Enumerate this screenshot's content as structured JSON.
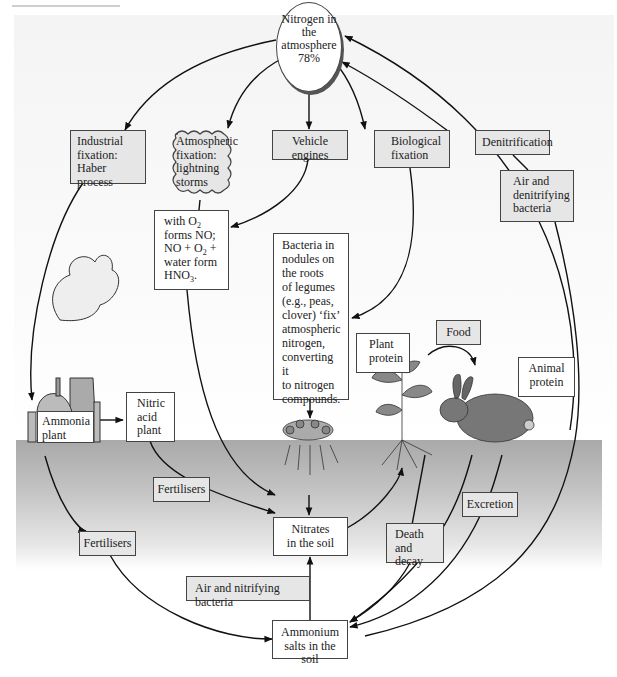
{
  "diagram": {
    "nodes": {
      "atmosphere": "Nitrogen in the atmosphere 78%",
      "industrial_fixation": [
        "Industrial",
        "fixation:",
        "Haber process"
      ],
      "atmospheric_fixation": [
        "Atmospheric",
        "fixation:",
        "lightning",
        "storms"
      ],
      "vehicle_engines": [
        "Vehicle",
        "engines"
      ],
      "biological_fixation": [
        "Biological",
        "fixation"
      ],
      "denitrification": "Denitrification",
      "air_denitrifying": [
        "Air and",
        "denitrifying",
        "bacteria"
      ],
      "no_formation": {
        "line1_pre": "with O",
        "line1_sub": "2",
        "line2": "forms NO;",
        "line3_pre": "NO + O",
        "line3_sub": "2",
        "line3_post": " +",
        "line4": "water form",
        "line5_pre": "HNO",
        "line5_sub": "3",
        "line5_post": "."
      },
      "legume_bacteria": [
        "Bacteria in",
        "nodules on",
        "the roots",
        "of legumes",
        "(e.g., peas,",
        "clover) ‘fix’",
        "atmospheric",
        "nitrogen,",
        "converting it",
        "to nitrogen",
        "compounds."
      ],
      "plant_protein": [
        "Plant",
        "protein"
      ],
      "food": "Food",
      "animal_protein": [
        "Animal",
        "protein"
      ],
      "ammonia_plant": [
        "Ammonia",
        "plant"
      ],
      "nitric_acid_plant": [
        "Nitric",
        "acid",
        "plant"
      ],
      "fertilisers_upper": "Fertilisers",
      "fertilisers_lower": "Fertilisers",
      "nitrates_soil": [
        "Nitrates",
        "in the soil"
      ],
      "excretion": "Excretion",
      "death_decay": [
        "Death",
        "and decay"
      ],
      "air_nitrifying": "Air and nitrifying bacteria",
      "ammonium_salts": [
        "Ammonium",
        "salts in the soil"
      ]
    },
    "illustrations": [
      "factory-smokestack",
      "legume-plant-with-root-nodules",
      "seedling-plant",
      "rabbit",
      "soil-layer"
    ],
    "colors": {
      "grey_box": "#e6e6e6",
      "white_box": "#ffffff",
      "border": "#444444",
      "soil_top": "#a9a9a9",
      "arrow": "#111111"
    }
  }
}
